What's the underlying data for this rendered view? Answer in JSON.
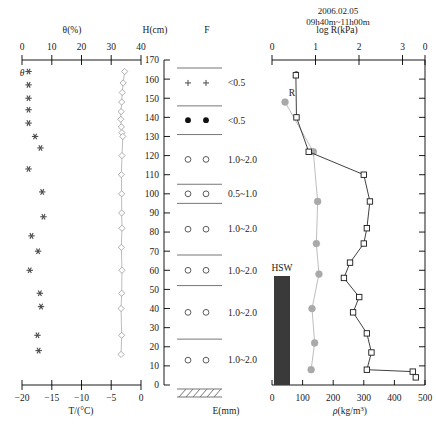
{
  "figure": {
    "title_line1": "2006.02.05",
    "title_line2": "09h40m~11h00m"
  },
  "panel_left": {
    "top_axis_label": "θ(%)",
    "top_ticks": [
      "0",
      "10",
      "20",
      "30",
      "40"
    ],
    "bottom_axis_label": "T/(°C)",
    "bottom_ticks": [
      "−20",
      "−15",
      "−10",
      "−5",
      "0"
    ],
    "series_label_theta": "θ"
  },
  "panel_height": {
    "axis_label": "H(cm)",
    "ticks": [
      "170",
      "160",
      "150",
      "140",
      "130",
      "120",
      "110",
      "100",
      "90",
      "80",
      "70",
      "60",
      "50",
      "40",
      "30",
      "20",
      "10",
      "0"
    ]
  },
  "panel_strat": {
    "header": "F",
    "footer_label": "E(mm)",
    "layers": [
      {
        "symbol": "plus",
        "size_label": "<0.5"
      },
      {
        "symbol": "dot",
        "size_label": "<0.5"
      },
      {
        "symbol": "circle",
        "size_label": "1.0~2.0"
      },
      {
        "symbol": "circle",
        "size_label": "0.5~1.0"
      },
      {
        "symbol": "circle",
        "size_label": "1.0~2.0"
      },
      {
        "symbol": "circle",
        "size_label": "1.0~2.0"
      },
      {
        "symbol": "circle",
        "size_label": "1.0~2.0"
      },
      {
        "symbol": "circle",
        "size_label": "1.0~2.0"
      }
    ]
  },
  "panel_right": {
    "top_axis_label": "log R(kPa)",
    "top_ticks": [
      "0",
      "1",
      "2",
      "3"
    ],
    "bottom_axis_label": "ρ(kg/m³)",
    "bottom_ticks": [
      "0",
      "100",
      "200",
      "300",
      "400",
      "500"
    ],
    "series_label_rho": "ρ",
    "series_label_R": "R",
    "hsw_label": "HSW"
  },
  "chart_data": [
    {
      "type": "scatter",
      "title": "Snow temperature profile",
      "xlabel": "T/(°C)",
      "ylabel": "H(cm)",
      "xlim": [
        -20,
        0
      ],
      "ylim": [
        0,
        170
      ],
      "marker": "asterisk",
      "series": [
        {
          "name": "T",
          "points": [
            [
              -18.9,
              164
            ],
            [
              -18.9,
              157
            ],
            [
              -18.9,
              150
            ],
            [
              -18.9,
              144
            ],
            [
              -18.9,
              137
            ],
            [
              -17.8,
              130
            ],
            [
              -16.9,
              124
            ],
            [
              -18.9,
              113
            ],
            [
              -16.6,
              101
            ],
            [
              -16.4,
              88
            ],
            [
              -18.4,
              78
            ],
            [
              -17.3,
              70
            ],
            [
              -18.7,
              60
            ],
            [
              -17.0,
              48
            ],
            [
              -16.8,
              41
            ],
            [
              -17.4,
              26
            ],
            [
              -17.2,
              18
            ]
          ]
        }
      ]
    },
    {
      "type": "line",
      "title": "Snow water content profile",
      "xlabel": "θ(%)",
      "ylabel": "H(cm)",
      "xlim": [
        0,
        40
      ],
      "ylim": [
        0,
        170
      ],
      "marker": "diamond",
      "series": [
        {
          "name": "θ",
          "points": [
            [
              34.5,
              164
            ],
            [
              34.0,
              158
            ],
            [
              33.7,
              153
            ],
            [
              33.5,
              148
            ],
            [
              33.3,
              143
            ],
            [
              33.2,
              139
            ],
            [
              33.4,
              135
            ],
            [
              33.6,
              132
            ],
            [
              33.9,
              130
            ],
            [
              33.6,
              120
            ],
            [
              33.4,
              110
            ],
            [
              33.5,
              100
            ],
            [
              33.5,
              90
            ],
            [
              33.6,
              82
            ],
            [
              33.4,
              72
            ],
            [
              33.6,
              60
            ],
            [
              33.5,
              48
            ],
            [
              33.3,
              40
            ],
            [
              33.5,
              26
            ],
            [
              33.3,
              16
            ]
          ]
        }
      ]
    },
    {
      "type": "line",
      "title": "Snow density profile",
      "xlabel": "ρ(kg/m³)",
      "ylabel": "H(cm)",
      "xlim": [
        0,
        500
      ],
      "ylim": [
        0,
        170
      ],
      "marker": "square",
      "series": [
        {
          "name": "ρ",
          "points": [
            [
              78,
              162
            ],
            [
              80,
              140
            ],
            [
              120,
              122
            ],
            [
              300,
              110
            ],
            [
              320,
              96
            ],
            [
              310,
              82
            ],
            [
              300,
              74
            ],
            [
              255,
              64
            ],
            [
              235,
              56
            ],
            [
              285,
              46
            ],
            [
              265,
              38
            ],
            [
              310,
              27
            ],
            [
              325,
              17
            ],
            [
              310,
              8
            ],
            [
              460,
              7
            ],
            [
              470,
              4
            ]
          ]
        }
      ]
    },
    {
      "type": "line",
      "title": "Snow hardness (log R) profile",
      "xlabel": "log R(kPa)",
      "ylabel": "H(cm)",
      "xlim": [
        0,
        3
      ],
      "ylim": [
        0,
        170
      ],
      "marker": "circle",
      "series": [
        {
          "name": "R",
          "points": [
            [
              0.3,
              148
            ],
            [
              0.95,
              122
            ],
            [
              1.05,
              96
            ],
            [
              1.02,
              74
            ],
            [
              1.08,
              58
            ],
            [
              0.92,
              40
            ],
            [
              0.98,
              22
            ],
            [
              0.9,
              8
            ]
          ]
        }
      ]
    },
    {
      "type": "bar",
      "title": "HSW layer",
      "xlabel": "ρ(kg/m³)",
      "ylabel": "H(cm)",
      "categories": [
        "HSW"
      ],
      "values": [
        50
      ],
      "y_extent": [
        2,
        57
      ]
    }
  ]
}
